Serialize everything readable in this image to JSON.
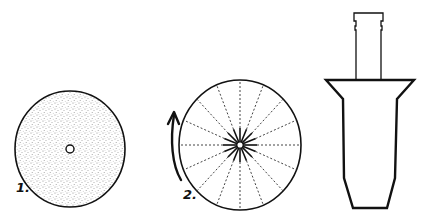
{
  "figure": {
    "colors": {
      "ink": "#111111",
      "stipple": "#9a9a9a",
      "background": "#ffffff"
    },
    "panels": [
      {
        "id": "disc-stippled",
        "label": "1.",
        "shape": "circle",
        "fill": "stippled",
        "center_hole": true
      },
      {
        "id": "disc-spoked",
        "label": "2.",
        "shape": "circle",
        "spokes": 16,
        "arrow": "counter-clockwise-up"
      },
      {
        "id": "funnel-vessel",
        "label": "",
        "shape": "funnel-profile"
      }
    ]
  }
}
